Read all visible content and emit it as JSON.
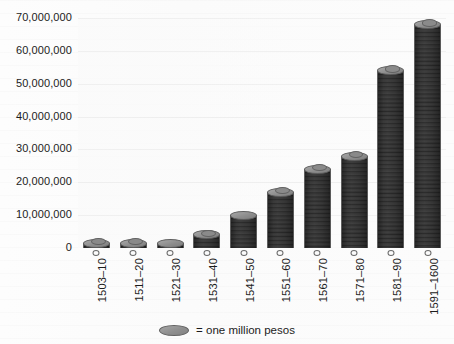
{
  "chart_data": {
    "type": "bar",
    "title": "",
    "subtitle": "",
    "xlabel": "",
    "ylabel": "",
    "categories": [
      "1503–10",
      "1511–20",
      "1521–30",
      "1531–40",
      "1541–50",
      "1551–60",
      "1561–70",
      "1571–80",
      "1581–90",
      "1591–1600"
    ],
    "values": [
      1000000,
      1500000,
      1000000,
      4000000,
      10000000,
      17000000,
      24000000,
      28000000,
      54000000,
      68000000
    ],
    "ylim": [
      0,
      70000000
    ],
    "ytick_values": [
      0,
      10000000,
      20000000,
      30000000,
      40000000,
      50000000,
      60000000,
      70000000
    ],
    "ytick_labels": [
      "0",
      "10,000,000",
      "20,000,000",
      "30,000,000",
      "40,000,000",
      "50,000,000",
      "60,000,000",
      "70,000,000"
    ],
    "grid": true,
    "legend_position": "bottom",
    "legend": [
      {
        "symbol": "coin-icon",
        "label": "= one million pesos"
      }
    ],
    "unit_note": "= one million pesos",
    "marker_style": "stacked-coins"
  },
  "legend": {
    "text": "= one million pesos"
  },
  "colors": {
    "coin_fill": "#949494",
    "coin_edge": "#5f5f5f",
    "coin_highlight": "#b0b0b0",
    "plot_background": "#fafafa",
    "page_background": "#ffffff",
    "text": "#1c1c1c",
    "gridline": "#f0f0f0"
  }
}
